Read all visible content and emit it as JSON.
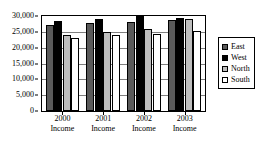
{
  "chart_data": {
    "type": "bar",
    "title": "",
    "xlabel": "",
    "ylabel": "",
    "categories": [
      "2000 Income",
      "2001 Income",
      "2002 Income",
      "2003 Income"
    ],
    "category_lines": [
      [
        "2000",
        "Income"
      ],
      [
        "2001",
        "Income"
      ],
      [
        "2002",
        "Income"
      ],
      [
        "2003",
        "Income"
      ]
    ],
    "series": [
      {
        "name": "East",
        "color": "#5a5a5a",
        "values": [
          27200,
          27700,
          28200,
          28700
        ]
      },
      {
        "name": "West",
        "color": "#000000",
        "values": [
          28500,
          29000,
          30000,
          29300
        ]
      },
      {
        "name": "North",
        "color": "#bdbdbd",
        "values": [
          24000,
          25000,
          26000,
          29200
        ]
      },
      {
        "name": "South",
        "color": "#ffffff",
        "values": [
          23000,
          24000,
          24200,
          25200
        ]
      }
    ],
    "ylim": [
      0,
      30000
    ],
    "yticks": [
      0,
      5000,
      10000,
      15000,
      20000,
      25000,
      30000
    ],
    "ytick_labels": [
      "0",
      "5,000",
      "10,000",
      "15,000",
      "20,000",
      "25,000",
      "30,000"
    ],
    "grid": true,
    "legend_position": "right"
  },
  "legend": {
    "items": [
      {
        "label": "East",
        "swatch": "legend-swatch-east"
      },
      {
        "label": "West",
        "swatch": "legend-swatch-west"
      },
      {
        "label": "North",
        "swatch": "legend-swatch-north"
      },
      {
        "label": "South",
        "swatch": "legend-swatch-south"
      }
    ]
  }
}
